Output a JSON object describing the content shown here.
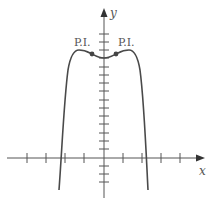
{
  "figure": {
    "type": "function-graph",
    "axes": {
      "x_label": "x",
      "y_label": "y",
      "x_ticks_count": 8,
      "y_ticks_count": 19
    },
    "annotations": {
      "left_inflection_label": "P.I.",
      "right_inflection_label": "P.I."
    },
    "colors": {
      "curve": "#4a4a4a",
      "axis": "#555555",
      "label": "#555555"
    }
  }
}
